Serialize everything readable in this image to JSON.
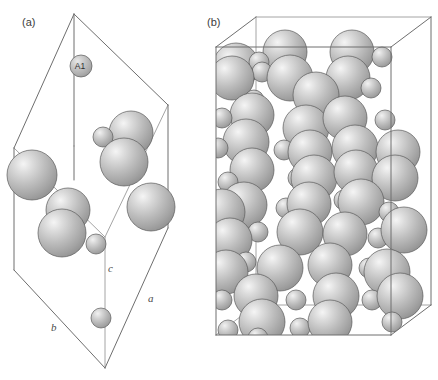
{
  "figure": {
    "type": "crystal-structure-diagram",
    "background_color": "#ffffff",
    "panels": [
      {
        "id": "a",
        "label": "(a)",
        "label_x": 22,
        "label_y": 26,
        "description": "Unit cell of the crystal structure viewed along an oblique direction, showing a small number of atoms inside a monoclinic/triclinic parallelepiped outline.",
        "axis_labels": [
          {
            "text": "a",
            "x": 148,
            "y": 302
          },
          {
            "text": "b",
            "x": 51,
            "y": 331
          },
          {
            "text": "c",
            "x": 108,
            "y": 272
          }
        ],
        "atom_labels": [
          {
            "text": "A1",
            "x": 80,
            "y": 67
          }
        ],
        "cell_vertices": {
          "top": [
            74,
            14
          ],
          "top_right": [
            168,
            105
          ],
          "left_upper": [
            14,
            148
          ],
          "center_mid": [
            105,
            237
          ],
          "left_lower": [
            14,
            270
          ],
          "right_lower": [
            168,
            228
          ],
          "bottom": [
            105,
            368
          ],
          "bottom_right": [
            168,
            228
          ]
        },
        "atoms": [
          {
            "cx": 81,
            "cy": 66,
            "r": 11,
            "kind": "labelled-large"
          },
          {
            "cx": 103,
            "cy": 137,
            "r": 10,
            "kind": "small"
          },
          {
            "cx": 131,
            "cy": 133,
            "r": 22,
            "kind": "large"
          },
          {
            "cx": 124,
            "cy": 162,
            "r": 24,
            "kind": "large"
          },
          {
            "cx": 32,
            "cy": 175,
            "r": 25,
            "kind": "large"
          },
          {
            "cx": 68,
            "cy": 210,
            "r": 22,
            "kind": "large"
          },
          {
            "cx": 62,
            "cy": 233,
            "r": 24,
            "kind": "large"
          },
          {
            "cx": 96,
            "cy": 244,
            "r": 10,
            "kind": "small"
          },
          {
            "cx": 151,
            "cy": 207,
            "r": 24,
            "kind": "large"
          },
          {
            "cx": 101,
            "cy": 318,
            "r": 10,
            "kind": "small"
          }
        ]
      },
      {
        "id": "b",
        "label": "(b)",
        "label_x": 207,
        "label_y": 26,
        "description": "Extended supercell of the same crystal structure showing many atoms packed inside a tall rectangular box drawn in perspective.",
        "axis_labels": [],
        "atom_labels": [],
        "box_vertices": {
          "front_top_left": [
            216,
            47
          ],
          "front_top_right": [
            391,
            47
          ],
          "front_bottom_left": [
            216,
            335
          ],
          "front_bottom_right": [
            391,
            335
          ],
          "back_top_left": [
            256,
            17
          ],
          "back_top_right": [
            431,
            17
          ],
          "back_bottom_left": [
            256,
            305
          ],
          "back_bottom_right": [
            431,
            305
          ]
        },
        "atom_counts": {
          "large": 46,
          "small": 30
        }
      }
    ],
    "sphere_style": {
      "large_radius_px": 23,
      "small_radius_px": 10,
      "highlight_color": "#f2f2f2",
      "mid_color": "#b8b8b8",
      "shadow_color": "#8a8a8a",
      "outline_color": "#5a5a5a"
    }
  }
}
